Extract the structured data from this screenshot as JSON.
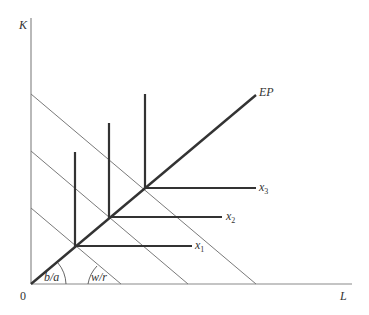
{
  "diagram": {
    "axes": {
      "y_label": "K",
      "x_label": "L",
      "origin_label": "0"
    },
    "expansion_path_label": "EP",
    "isoquants": [
      {
        "label": "x",
        "sub": "1"
      },
      {
        "label": "x",
        "sub": "2"
      },
      {
        "label": "x",
        "sub": "3"
      }
    ],
    "angle_labels": {
      "ray_slope": "b/a",
      "isocost_slope": "w/r"
    },
    "colors": {
      "axis": "#8a8a8a",
      "thick": "#333333",
      "thin": "#7a7a7a",
      "text": "#333333"
    }
  }
}
